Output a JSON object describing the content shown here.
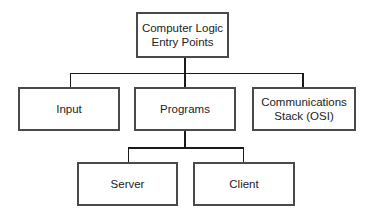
{
  "diagram": {
    "type": "hierarchy",
    "root": {
      "line1": "Computer Logic",
      "line2": "Entry Points"
    },
    "level1": [
      {
        "label": "Input"
      },
      {
        "label": "Programs"
      },
      {
        "line1": "Communications",
        "line2": "Stack (OSI)"
      }
    ],
    "level2": [
      {
        "label": "Server"
      },
      {
        "label": "Client"
      }
    ],
    "edges": [
      [
        "Computer Logic Entry Points",
        "Input"
      ],
      [
        "Computer Logic Entry Points",
        "Programs"
      ],
      [
        "Computer Logic Entry Points",
        "Communications Stack (OSI)"
      ],
      [
        "Programs",
        "Server"
      ],
      [
        "Programs",
        "Client"
      ]
    ]
  }
}
